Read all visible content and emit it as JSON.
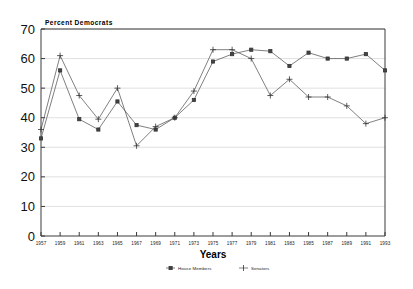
{
  "chart_data": {
    "type": "line",
    "title": "Percent Democrats",
    "xlabel": "Years",
    "ylabel": "",
    "xlim": [
      1957,
      1993
    ],
    "ylim": [
      0,
      70
    ],
    "grid": true,
    "legend_position": "bottom",
    "x": [
      1957,
      1959,
      1961,
      1963,
      1965,
      1967,
      1969,
      1971,
      1973,
      1975,
      1977,
      1979,
      1981,
      1983,
      1985,
      1987,
      1989,
      1991,
      1993
    ],
    "xtick_labels": [
      "1957",
      "1959",
      "1961",
      "1963",
      "1965",
      "1967",
      "1969",
      "1971",
      "1973",
      "1975",
      "1977",
      "1979",
      "1981",
      "1983",
      "1985",
      "1987",
      "1989",
      "1991",
      "1993"
    ],
    "ytick_labels": [
      "0",
      "10",
      "20",
      "30",
      "40",
      "50",
      "60",
      "70"
    ],
    "ytick_values": [
      0,
      10,
      20,
      30,
      40,
      50,
      60,
      70
    ],
    "series": [
      {
        "name": "House Members",
        "marker": "square",
        "values": [
          33.0,
          56.0,
          39.5,
          36.0,
          45.5,
          37.5,
          36.0,
          40.0,
          46.0,
          59.0,
          61.5,
          63.0,
          62.5,
          57.5,
          62.0,
          60.0,
          60.0,
          61.5,
          56.0
        ]
      },
      {
        "name": "Senators",
        "marker": "plus",
        "values": [
          36.0,
          61.0,
          47.5,
          39.5,
          50.0,
          30.5,
          37.0,
          40.0,
          49.0,
          63.0,
          63.0,
          60.0,
          47.5,
          53.0,
          47.0,
          47.0,
          44.0,
          38.0,
          40.0
        ]
      }
    ]
  },
  "legend": {
    "items": [
      {
        "label": "House Members",
        "marker": "square"
      },
      {
        "label": "Senators",
        "marker": "plus"
      }
    ]
  }
}
